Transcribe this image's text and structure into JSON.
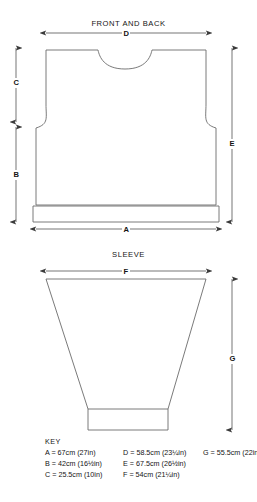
{
  "diagram": {
    "title_front_back": "FRONT AND BACK",
    "title_sleeve": "SLEEVE",
    "dimension_labels": {
      "A": "A",
      "B": "B",
      "C": "C",
      "D": "D",
      "E": "E",
      "F": "F",
      "G": "G"
    },
    "line_color": "#6b6b6b",
    "arrow_color": "#3a3a3a",
    "background": "#ffffff"
  },
  "key": {
    "title": "KEY",
    "entries": [
      {
        "id": "A",
        "text": "A = 67cm (27in)"
      },
      {
        "id": "D",
        "text": "D = 58.5cm (23¼in)"
      },
      {
        "id": "G",
        "text": "G = 55.5cm (22in)"
      },
      {
        "id": "B",
        "text": "B = 42cm (16½in)"
      },
      {
        "id": "E",
        "text": "E = 67.5cm (26½in)"
      },
      {
        "id": "blank1",
        "text": ""
      },
      {
        "id": "C",
        "text": "C = 25.5cm (10in)"
      },
      {
        "id": "F",
        "text": "F = 54cm (21¼in)"
      },
      {
        "id": "blank2",
        "text": ""
      }
    ]
  },
  "measurements": {
    "A": {
      "cm": 67,
      "inches": "27"
    },
    "B": {
      "cm": 42,
      "inches": "16½"
    },
    "C": {
      "cm": 25.5,
      "inches": "10"
    },
    "D": {
      "cm": 58.5,
      "inches": "23¼"
    },
    "E": {
      "cm": 67.5,
      "inches": "26½"
    },
    "F": {
      "cm": 54,
      "inches": "21¼"
    },
    "G": {
      "cm": 55.5,
      "inches": "22"
    }
  }
}
